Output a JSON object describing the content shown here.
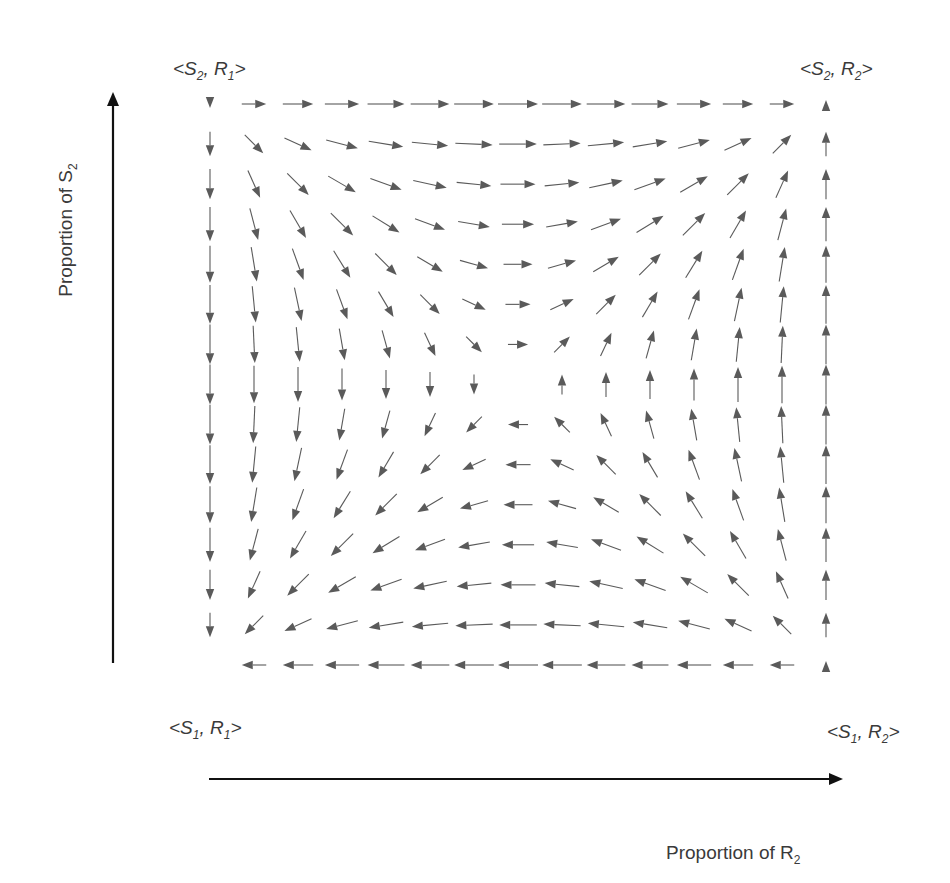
{
  "corners": {
    "top_left": {
      "prefix": "<",
      "s": "S",
      "s_sub": "2",
      "sep": ", ",
      "r": "R",
      "r_sub": "1",
      "suffix": ">"
    },
    "top_right": {
      "prefix": "<",
      "s": "S",
      "s_sub": "2",
      "sep": ", ",
      "r": "R",
      "r_sub": "2",
      "suffix": ">"
    },
    "bottom_left": {
      "prefix": "<",
      "s": "S",
      "s_sub": "1",
      "sep": ", ",
      "r": "R",
      "r_sub": "1",
      "suffix": ">"
    },
    "bottom_right": {
      "prefix": "<",
      "s": "S",
      "s_sub": "1",
      "sep": ", ",
      "r": "R",
      "r_sub": "2",
      "suffix": ">"
    }
  },
  "axes": {
    "y": {
      "label": "Proportion of S",
      "sub": "2"
    },
    "x": {
      "label": "Proportion of R",
      "sub": "2"
    }
  },
  "field": {
    "description": "Replicator-dynamics direction field on the unit square; x = proportion of R2, y = proportion of S2",
    "grid_cols": 15,
    "grid_rows": 15,
    "x_px_range": [
      210,
      826
    ],
    "y_px_range": [
      104,
      665
    ],
    "equation_dx": "u(1-u)(v-0.5)",
    "equation_dy": "v(1-v)(u-0.5)",
    "min_len": 8,
    "max_len": 40
  },
  "colors": {
    "arrow": "#5a5a5a",
    "axis": "#111111",
    "text": "#3a3a3a"
  }
}
